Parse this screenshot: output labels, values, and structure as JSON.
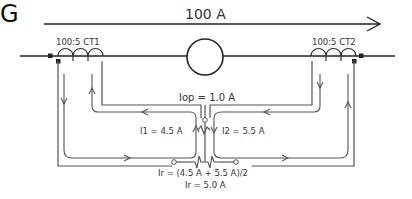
{
  "diagram": {
    "type": "differential-relay-circuit",
    "primary_current": "100 A",
    "generator_label": "G",
    "ct1_label": "100:5 CT1",
    "ct2_label": "100:5 CT2",
    "operate_current": "Iop = 1.0 A",
    "i1": "I1 = 4.5 A",
    "i2": "I2 = 5.5 A",
    "restraint_formula": "Ir = (4.5 A + 5.5 A)/2",
    "restraint_result": "Ir = 5.0 A"
  },
  "colors": {
    "line": "#555555",
    "primary": "#222222",
    "text": "#333333"
  }
}
